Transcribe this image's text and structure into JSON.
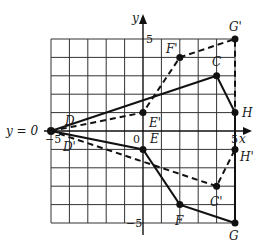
{
  "diagram": {
    "type": "coordinate-plane-reflection",
    "grid": {
      "xmin": -5,
      "xmax": 5,
      "ymin": -5,
      "ymax": 5,
      "step": 1
    },
    "axes": {
      "x_label": "x",
      "y_label": "y",
      "tick_labels": {
        "x_neg": "−5",
        "x_pos": "5",
        "y_pos": "5",
        "y_neg": "−5",
        "origin": "0"
      }
    },
    "line_label": "y = 0",
    "original": {
      "style": "solid",
      "points": [
        {
          "name": "D",
          "x": -5,
          "y": 0
        },
        {
          "name": "C",
          "x": 4,
          "y": 3
        },
        {
          "name": "H",
          "x": 5,
          "y": 1
        },
        {
          "name": "G",
          "x": 5,
          "y": -5
        },
        {
          "name": "F",
          "x": 2,
          "y": -4
        },
        {
          "name": "E",
          "x": 0,
          "y": -1
        }
      ]
    },
    "image": {
      "style": "dashed",
      "points": [
        {
          "name": "D'",
          "x": -5,
          "y": 0
        },
        {
          "name": "E'",
          "x": 0,
          "y": 1
        },
        {
          "name": "F'",
          "x": 2,
          "y": 4
        },
        {
          "name": "G'",
          "x": 5,
          "y": 5
        },
        {
          "name": "H'",
          "x": 5,
          "y": -1
        },
        {
          "name": "C'",
          "x": 4,
          "y": -3
        }
      ]
    }
  }
}
